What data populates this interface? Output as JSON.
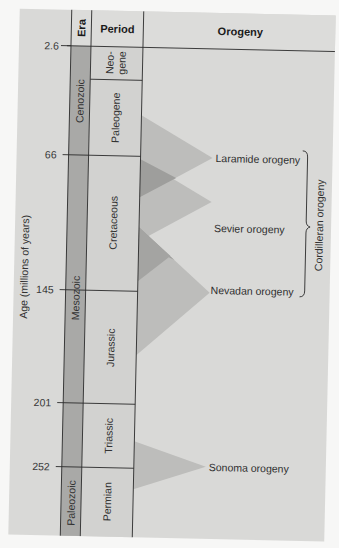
{
  "figure": {
    "headers": {
      "era": "Era",
      "period": "Period",
      "orogeny": "Orogeny"
    },
    "y_axis_label": "Age (millions of years)",
    "ticks": [
      {
        "label": "2.6",
        "value": 2.6
      },
      {
        "label": "66",
        "value": 66
      },
      {
        "label": "145",
        "value": 145
      },
      {
        "label": "201",
        "value": 201
      },
      {
        "label": "252",
        "value": 252
      }
    ],
    "eras": [
      {
        "name": "Cenozoic",
        "start": 0,
        "end": 66
      },
      {
        "name": "Mesozoic",
        "start": 66,
        "end": 252
      },
      {
        "name": "Paleozoic",
        "start": 252,
        "end": 299
      }
    ],
    "periods": [
      {
        "name": "Neo-",
        "name2": "gene",
        "start": 2.6,
        "end": 23
      },
      {
        "name": "Paleogene",
        "start": 23,
        "end": 66
      },
      {
        "name": "Cretaceous",
        "start": 66,
        "end": 145
      },
      {
        "name": "Jurassic",
        "start": 145,
        "end": 201
      },
      {
        "name": "Triassic",
        "start": 201,
        "end": 252
      },
      {
        "name": "Permian",
        "start": 252,
        "end": 299
      }
    ],
    "orogenies": [
      {
        "name": "Laramide orogeny"
      },
      {
        "name": "Sevier orogeny"
      },
      {
        "name": "Nevadan orogeny"
      },
      {
        "name": "Sonoma orogeny"
      }
    ],
    "group_bracket": {
      "label": "Cordilleran orogeny",
      "spans": [
        "Laramide orogeny",
        "Sevier orogeny",
        "Nevadan orogeny"
      ]
    },
    "colors": {
      "page": "#d9d9d7",
      "era_fill": "#a9a9a7",
      "period_fill": "#d2d2d0",
      "header_fill": "#dcdcda",
      "triangle": "#b9b9b7",
      "triangle_overlap": "#9c9c9a",
      "line": "#2b2b2b",
      "background": "#f7f7f6"
    }
  }
}
